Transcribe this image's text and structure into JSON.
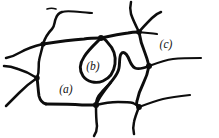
{
  "figure": {
    "kind": "hand-drawn-line-diagram",
    "background_color": "#ffffff",
    "ink_color": "#0d0d0d",
    "width": 219,
    "height": 138,
    "labels": [
      {
        "id": "a",
        "text": "(a)",
        "x": 66,
        "y": 93,
        "refers_to": "large central cell region"
      },
      {
        "id": "b",
        "text": "(b)",
        "x": 93,
        "y": 70,
        "refers_to": "small teardrop loop enclosed inside the central cell"
      },
      {
        "id": "c",
        "text": "(c)",
        "x": 166,
        "y": 48,
        "refers_to": "upper right region beside the network"
      }
    ],
    "junctions": [
      {
        "name": "left-upper-node",
        "x": 43,
        "y": 44
      },
      {
        "name": "left-lower-node",
        "x": 37,
        "y": 78
      },
      {
        "name": "top-loop-node",
        "x": 101,
        "y": 38
      },
      {
        "name": "top-right-fork-node",
        "x": 139,
        "y": 32
      },
      {
        "name": "right-mid-node",
        "x": 149,
        "y": 66
      },
      {
        "name": "bottom-node",
        "x": 96,
        "y": 105
      },
      {
        "name": "bottom-right-node",
        "x": 139,
        "y": 107
      }
    ],
    "features": [
      "detached short tick mark near the top-left branch tip",
      "Y-shaped fork opening upward at the top right",
      "teardrop loop (b) hanging below the top edge of the central cell",
      "jagged arrow-like inner loop in the lower right of the network",
      "several free branch ends running off the left and right borders"
    ]
  }
}
